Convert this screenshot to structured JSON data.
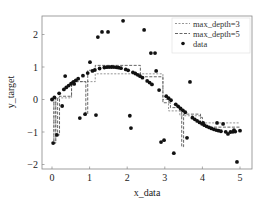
{
  "chart_data": {
    "type": "scatter",
    "title": "",
    "xlabel": "x_data",
    "ylabel": "y_target",
    "xlim": [
      -0.27,
      5.3
    ],
    "ylim": [
      -2.15,
      2.55
    ],
    "xticks": [
      0,
      1,
      2,
      3,
      4,
      5
    ],
    "yticks": [
      -2,
      -1,
      0,
      1,
      2
    ],
    "xtick_labels": [
      "0",
      "1",
      "2",
      "3",
      "4",
      "5"
    ],
    "ytick_labels": [
      "−2",
      "−1",
      "0",
      "1",
      "2"
    ],
    "grid": false,
    "legend_position": "upper right",
    "legend": [
      "max_depth=3",
      "max_depth=5",
      "data"
    ],
    "series": [
      {
        "name": "data",
        "kind": "scatter",
        "color": "#111111",
        "underlying_function": "sin(x) sampled densely on [0,5]",
        "outliers": [
          [
            0.03,
            -1.34
          ],
          [
            0.13,
            -1.09
          ],
          [
            0.27,
            -0.2
          ],
          [
            0.35,
            0.72
          ],
          [
            0.59,
            0.48
          ],
          [
            0.74,
            -0.57
          ],
          [
            0.88,
            -0.45
          ],
          [
            1.01,
            1.15
          ],
          [
            1.17,
            -0.48
          ],
          [
            1.22,
            1.92
          ],
          [
            1.33,
            2.08
          ],
          [
            1.49,
            2.08
          ],
          [
            1.89,
            2.42
          ],
          [
            2.07,
            -0.5
          ],
          [
            2.1,
            -0.88
          ],
          [
            2.45,
            2.14
          ],
          [
            2.63,
            1.43
          ],
          [
            2.74,
            1.43
          ],
          [
            2.77,
            0.88
          ],
          [
            2.9,
            -1.31
          ],
          [
            2.98,
            -1.25
          ],
          [
            3.24,
            -1.65
          ],
          [
            3.59,
            -1.18
          ],
          [
            3.67,
            0.54
          ],
          [
            4.02,
            -0.72
          ],
          [
            4.39,
            -0.72
          ],
          [
            4.55,
            -0.75
          ],
          [
            4.68,
            -1.06
          ],
          [
            4.84,
            -0.94
          ],
          [
            4.92,
            -1.92
          ]
        ]
      },
      {
        "name": "max_depth=3",
        "kind": "step",
        "color": "#8a8a8a",
        "dash": "2,1.5",
        "steps": [
          [
            0.0,
            0.0
          ],
          [
            0.05,
            -1.34
          ],
          [
            0.1,
            0.05
          ],
          [
            0.52,
            0.55
          ],
          [
            1.15,
            0.79
          ],
          [
            2.9,
            0.79
          ],
          [
            2.95,
            0.0
          ],
          [
            3.1,
            -0.35
          ],
          [
            3.4,
            -0.5
          ],
          [
            3.95,
            -0.72
          ],
          [
            5.0,
            -0.72
          ]
        ]
      },
      {
        "name": "max_depth=5",
        "kind": "step",
        "color": "#555555",
        "dash": "3,1.5",
        "steps": [
          [
            0.0,
            0.0
          ],
          [
            0.05,
            -1.34
          ],
          [
            0.1,
            0.05
          ],
          [
            0.15,
            -1.09
          ],
          [
            0.2,
            0.1
          ],
          [
            0.52,
            0.55
          ],
          [
            0.85,
            0.55
          ],
          [
            0.9,
            -0.45
          ],
          [
            0.95,
            0.9
          ],
          [
            1.15,
            1.05
          ],
          [
            2.3,
            1.05
          ],
          [
            2.35,
            0.7
          ],
          [
            2.9,
            0.7
          ],
          [
            2.95,
            -0.1
          ],
          [
            3.15,
            -0.25
          ],
          [
            3.4,
            -0.35
          ],
          [
            3.45,
            -1.45
          ],
          [
            3.5,
            -0.45
          ],
          [
            3.95,
            -0.55
          ],
          [
            4.0,
            -0.75
          ],
          [
            4.05,
            -0.85
          ],
          [
            5.0,
            -0.85
          ]
        ]
      }
    ]
  }
}
